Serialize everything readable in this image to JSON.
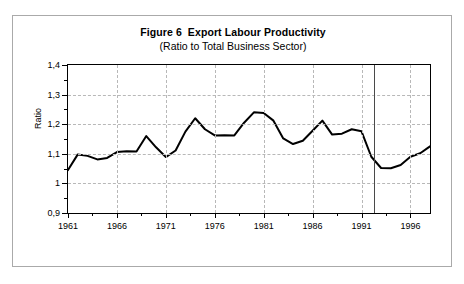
{
  "figure": {
    "title": "Figure 6  Export Labour Productivity",
    "subtitle": "(Ratio to Total Business Sector)"
  },
  "chart_data": {
    "type": "line",
    "title": "Figure 6  Export Labour Productivity",
    "subtitle": "(Ratio to Total Business Sector)",
    "xlabel": "",
    "ylabel": "Ratio",
    "xlim": [
      1961,
      1998
    ],
    "ylim": [
      0.9,
      1.4
    ],
    "grid": true,
    "legend": null,
    "y_tick_labels": [
      "1,4",
      "1,3",
      "1,2",
      "1,1",
      "1",
      "0,9"
    ],
    "y_tick_values": [
      1.4,
      1.3,
      1.2,
      1.1,
      1.0,
      0.9
    ],
    "y_minor_tick_values": [
      1.35,
      1.25,
      1.15,
      1.05,
      0.95
    ],
    "x_tick_labels": [
      "1961",
      "1966",
      "1971",
      "1976",
      "1981",
      "1986",
      "1991",
      "1996"
    ],
    "x_tick_values": [
      1961,
      1966,
      1971,
      1976,
      1981,
      1986,
      1991,
      1996
    ],
    "x_minor_tick_values": [
      1963.5,
      1968.5,
      1973.5,
      1978.5,
      1983.5,
      1988.5,
      1993.5
    ],
    "vertical_marker": 1992.3,
    "series": [
      {
        "name": "Export Labour Productivity",
        "color": "#000000",
        "x": [
          1961,
          1962,
          1963,
          1964,
          1965,
          1966,
          1967,
          1968,
          1969,
          1970,
          1971,
          1972,
          1973,
          1974,
          1975,
          1976,
          1977,
          1978,
          1979,
          1980,
          1981,
          1982,
          1983,
          1984,
          1985,
          1986,
          1987,
          1988,
          1989,
          1990,
          1991,
          1992,
          1993,
          1994,
          1995,
          1996,
          1997,
          1998
        ],
        "values": [
          1.045,
          1.098,
          1.093,
          1.081,
          1.086,
          1.106,
          1.109,
          1.108,
          1.16,
          1.122,
          1.089,
          1.111,
          1.175,
          1.22,
          1.183,
          1.162,
          1.163,
          1.162,
          1.205,
          1.24,
          1.238,
          1.212,
          1.152,
          1.133,
          1.144,
          1.178,
          1.212,
          1.165,
          1.168,
          1.183,
          1.176,
          1.09,
          1.052,
          1.051,
          1.062,
          1.09,
          1.102,
          1.125
        ]
      }
    ]
  }
}
